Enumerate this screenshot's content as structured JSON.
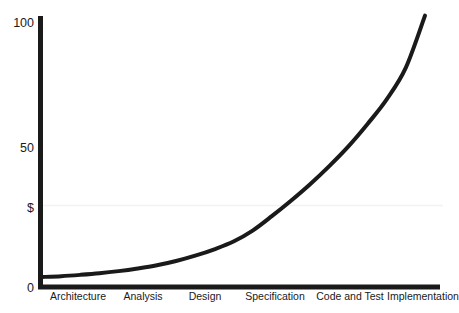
{
  "chart_data": {
    "type": "line",
    "title": "",
    "subtitle": "",
    "xlabel": "",
    "ylabel": "$",
    "categories": [
      "Architecture",
      "Analysis",
      "Design",
      "Specification",
      "Code and Test",
      "Implementation"
    ],
    "series": [
      {
        "name": "Cost of change",
        "values": [
          3,
          5,
          11,
          26,
          52,
          100
        ]
      }
    ],
    "x": [
      0,
      1,
      2,
      3,
      4,
      5
    ],
    "ylim": [
      0,
      105
    ],
    "xlim": [
      0,
      5
    ],
    "yticks": [
      0,
      50,
      100
    ],
    "ytick_labels": [
      "0",
      "50",
      "100"
    ],
    "annotations": [
      {
        "name": "dollar-axis-marker",
        "text": "$",
        "y": 25
      }
    ],
    "grid": "single-faint-horizontal-line-at-dollar-level",
    "legend": "none",
    "line_color": "#1a1a1a",
    "line_width": 4,
    "background_color": "#ffffff",
    "axis_color": "#1a1a1a",
    "curve_points": [
      [
        0.0,
        3.0
      ],
      [
        0.25,
        3.3
      ],
      [
        0.5,
        3.8
      ],
      [
        0.75,
        4.4
      ],
      [
        1.0,
        5.2
      ],
      [
        1.25,
        6.2
      ],
      [
        1.5,
        7.4
      ],
      [
        1.75,
        9.0
      ],
      [
        2.0,
        11.0
      ],
      [
        2.25,
        13.4
      ],
      [
        2.5,
        16.3
      ],
      [
        2.75,
        20.4
      ],
      [
        3.0,
        25.8
      ],
      [
        3.25,
        31.6
      ],
      [
        3.5,
        37.8
      ],
      [
        3.75,
        44.6
      ],
      [
        4.0,
        52.0
      ],
      [
        4.25,
        60.4
      ],
      [
        4.5,
        69.6
      ],
      [
        4.75,
        81.5
      ],
      [
        5.0,
        101.0
      ]
    ]
  },
  "axes": {
    "y": {
      "tick_100": "100",
      "tick_50": "50",
      "tick_dollar": "$",
      "tick_0": "0"
    },
    "x": {
      "cat_0": "Architecture",
      "cat_1": "Analysis",
      "cat_2": "Design",
      "cat_3": "Specification",
      "cat_4": "Code and Test",
      "cat_5": "Implementation"
    }
  },
  "colors": {
    "line": "#1a1a1a",
    "axis": "#1a1a1a",
    "gridline": "#f2f2f2",
    "text": "#1a1a1a",
    "background": "#ffffff"
  }
}
